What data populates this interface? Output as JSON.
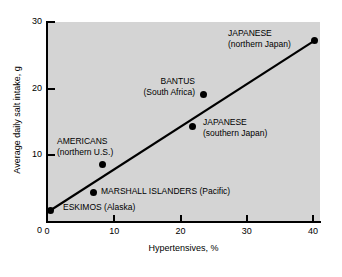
{
  "chart_data": {
    "type": "scatter",
    "title": "",
    "xlabel": "Hypertensives, %",
    "ylabel": "Average daily salt intake, g",
    "xlim": [
      0,
      41
    ],
    "ylim": [
      0,
      30
    ],
    "xticks": [
      "0",
      "10",
      "20",
      "30",
      "40"
    ],
    "xtick_values": [
      0,
      10,
      20,
      30,
      40
    ],
    "yticks": [
      "0",
      "10",
      "20",
      "30"
    ],
    "ytick_values": [
      0,
      10,
      20,
      30
    ],
    "grid": false,
    "legend": "none",
    "points": [
      {
        "name": "eskimos",
        "x": 0.6,
        "y": 1.8,
        "label_line1": "ESKIMOS (Alaska)",
        "label_line2": ""
      },
      {
        "name": "marshall-islanders",
        "x": 7.0,
        "y": 4.5,
        "label_line1": "MARSHALL ISLANDERS (Pacific)",
        "label_line2": ""
      },
      {
        "name": "americans",
        "x": 8.4,
        "y": 8.7,
        "label_line1": "AMERICANS",
        "label_line2": "(northern U.S.)"
      },
      {
        "name": "japanese-southern",
        "x": 21.9,
        "y": 14.4,
        "label_line1": "JAPANESE",
        "label_line2": "(southern Japan)"
      },
      {
        "name": "bantus",
        "x": 23.6,
        "y": 19.1,
        "label_line1": "BANTUS",
        "label_line2": "(South Africa)"
      },
      {
        "name": "japanese-northern",
        "x": 40.3,
        "y": 27.2,
        "label_line1": "JAPANESE",
        "label_line2": "(northern Japan)"
      }
    ],
    "trendline": {
      "x_start": 0.6,
      "y_start": 1.8,
      "x_end": 40.3,
      "y_end": 27.2
    },
    "colors": {
      "plot_background": "#d4d4d4",
      "page_background": "#ffffff",
      "axis": "#000000",
      "marker": "#000000",
      "trendline": "#000000"
    }
  }
}
